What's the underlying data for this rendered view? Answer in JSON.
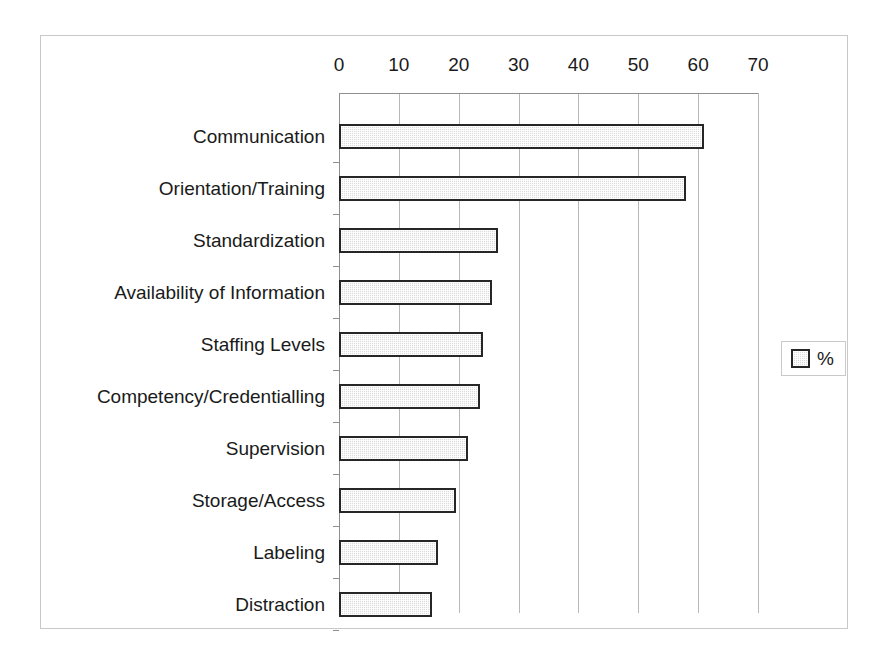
{
  "chart_data": {
    "type": "bar",
    "orientation": "horizontal",
    "title": "",
    "subtitle": "",
    "xlabel": "",
    "ylabel": "",
    "xlim": [
      0,
      70
    ],
    "xticks": [
      0,
      10,
      20,
      30,
      40,
      50,
      60,
      70
    ],
    "xtick_labels": [
      "0",
      "10",
      "20",
      "30",
      "40",
      "50",
      "60",
      "70"
    ],
    "grid": "vertical",
    "legend": {
      "position": "right",
      "entries": [
        {
          "label": "%",
          "swatch": "pattern-dotted-gray"
        }
      ]
    },
    "categories": [
      "Communication",
      "Orientation/Training",
      "Standardization",
      "Availability of Information",
      "Staffing Levels",
      "Competency/Credentialling",
      "Supervision",
      "Storage/Access",
      "Labeling",
      "Distraction"
    ],
    "series": [
      {
        "name": "%",
        "values": [
          61,
          58,
          26.5,
          25.5,
          24,
          23.5,
          21.5,
          19.5,
          16.5,
          15.5
        ]
      }
    ]
  },
  "style": {
    "bar_fill": "#dcdcdc",
    "bar_border": "#262626",
    "gridline_color": "#b8b8b8",
    "axis_color": "#8f8f8f",
    "frame_color": "#c9c9c9",
    "text_color": "#1a1a1a",
    "background": "#ffffff"
  }
}
